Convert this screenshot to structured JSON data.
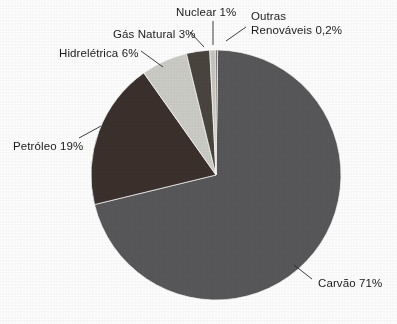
{
  "chart_data": {
    "type": "pie",
    "title": "",
    "subtitle": "",
    "xlabel": "",
    "ylabel": "",
    "legend_position": "none",
    "grid": false,
    "units": "%",
    "decimal_separator": ",",
    "total": 100.2,
    "categories": [
      "Carvão",
      "Petróleo",
      "Hidrelétrica",
      "Gás Natural",
      "Nuclear",
      "Outras Renováveis"
    ],
    "values": [
      71,
      19,
      6,
      3,
      1,
      0.2
    ],
    "value_labels": [
      "71%",
      "19%",
      "6%",
      "3%",
      "1%",
      "0,2%"
    ],
    "colors": [
      "#58585a",
      "#3b302c",
      "#cdcdc8",
      "#4a443f",
      "#c8c8c3",
      "#3a302b"
    ],
    "slices": [
      {
        "name": "Carvao",
        "label": "Carvão 71%",
        "category": "Carvão",
        "value": 71,
        "value_label": "71%",
        "color": "#58585a",
        "start_angle": 0.72,
        "end_angle": 256.32,
        "label_x": 318,
        "label_y": 277,
        "leader": {
          "x1": 312,
          "y1": 279,
          "x2": 294,
          "y2": 265
        }
      },
      {
        "name": "Petroleo",
        "label": "Petróleo 19%",
        "category": "Petróleo",
        "value": 19,
        "value_label": "19%",
        "color": "#3b302c",
        "start_angle": 256.32,
        "end_angle": 324.72,
        "label_x": 13,
        "label_y": 140,
        "leader": {
          "x1": 79,
          "y1": 138,
          "x2": 101,
          "y2": 126
        }
      },
      {
        "name": "Hidreletrica",
        "label": "Hidrelétrica 6%",
        "category": "Hidrelétrica",
        "value": 6,
        "value_label": "6%",
        "color": "#cdcdc8",
        "start_angle": 324.72,
        "end_angle": 346.32,
        "label_x": 59,
        "label_y": 47,
        "leader": {
          "x1": 141,
          "y1": 51,
          "x2": 163,
          "y2": 67
        }
      },
      {
        "name": "GasNatural",
        "label": "Gás Natural 3%",
        "category": "Gás Natural",
        "value": 3,
        "value_label": "3%",
        "color": "#4a443f",
        "start_angle": 346.32,
        "end_angle": 357.12,
        "label_x": 113,
        "label_y": 28,
        "leader": {
          "x1": 190,
          "y1": 32,
          "x2": 204,
          "y2": 47
        }
      },
      {
        "name": "Nuclear",
        "label": "Nuclear 1%",
        "category": "Nuclear",
        "value": 1,
        "value_label": "1%",
        "color": "#c8c8c3",
        "start_angle": 357.12,
        "end_angle": 360.72,
        "label_x": 176,
        "label_y": 6,
        "leader": {
          "x1": 213,
          "y1": 21,
          "x2": 213,
          "y2": 45
        }
      },
      {
        "name": "OutrasRenovaveis",
        "label": "Outras\nRenováveis 0,2%",
        "category": "Outras Renováveis",
        "value": 0.2,
        "value_label": "0,2%",
        "color": "#3a302b",
        "start_angle": 0,
        "end_angle": 0.72,
        "label_x": 251,
        "label_y": 10,
        "leader": {
          "x1": 246,
          "y1": 27,
          "x2": 226,
          "y2": 41
        }
      }
    ],
    "geometry": {
      "center_x": 216,
      "center_y": 175,
      "radius": 125
    }
  }
}
